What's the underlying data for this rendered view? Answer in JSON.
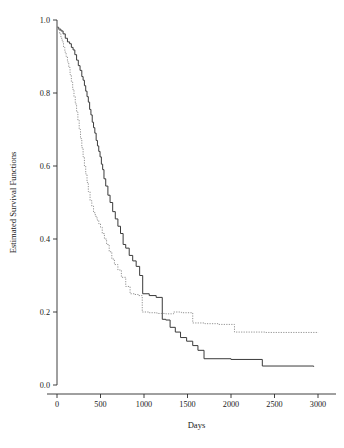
{
  "chart_data": {
    "type": "line",
    "title": "",
    "subtitle": "",
    "xlabel": "Days",
    "ylabel": "Estimated Survival Functions",
    "xlim": [
      0,
      3100
    ],
    "ylim": [
      0.0,
      1.0
    ],
    "xticks": [
      0,
      500,
      1000,
      1500,
      2000,
      2500,
      3000
    ],
    "xtick_labels": [
      "0",
      "500",
      "1000",
      "1500",
      "2000",
      "2500",
      "3000"
    ],
    "yticks": [
      0.0,
      0.2,
      0.4,
      0.6,
      0.8,
      1.0
    ],
    "ytick_labels": [
      "0.0",
      "0.2",
      "0.4",
      "0.6",
      "0.8",
      "1.0"
    ],
    "grid": false,
    "legend": "none",
    "step_type": "post",
    "series": [
      {
        "name": "solid-curve",
        "style": "solid",
        "color": "#3a3a3a",
        "x": [
          0,
          20,
          45,
          70,
          95,
          120,
          145,
          165,
          185,
          205,
          225,
          245,
          265,
          285,
          300,
          315,
          330,
          345,
          360,
          375,
          390,
          405,
          420,
          435,
          450,
          465,
          480,
          495,
          510,
          525,
          540,
          560,
          585,
          610,
          640,
          670,
          700,
          730,
          760,
          790,
          830,
          870,
          910,
          950,
          985,
          1060,
          1140,
          1210,
          1250,
          1300,
          1360,
          1420,
          1490,
          1560,
          1620,
          1690,
          2000,
          2360,
          2950
        ],
        "y": [
          0.98,
          0.975,
          0.97,
          0.962,
          0.95,
          0.94,
          0.935,
          0.925,
          0.918,
          0.905,
          0.89,
          0.875,
          0.862,
          0.845,
          0.835,
          0.82,
          0.805,
          0.79,
          0.775,
          0.755,
          0.74,
          0.72,
          0.705,
          0.69,
          0.67,
          0.655,
          0.64,
          0.625,
          0.605,
          0.59,
          0.565,
          0.545,
          0.52,
          0.5,
          0.475,
          0.455,
          0.435,
          0.415,
          0.385,
          0.375,
          0.355,
          0.34,
          0.325,
          0.3,
          0.25,
          0.245,
          0.24,
          0.18,
          0.178,
          0.158,
          0.145,
          0.13,
          0.12,
          0.108,
          0.095,
          0.072,
          0.07,
          0.052,
          0.05
        ]
      },
      {
        "name": "dotted-curve",
        "style": "dotted",
        "color": "#8c8c8c",
        "x": [
          0,
          15,
          30,
          45,
          60,
          75,
          90,
          105,
          120,
          135,
          150,
          165,
          180,
          195,
          210,
          225,
          240,
          255,
          270,
          285,
          300,
          315,
          330,
          345,
          360,
          380,
          400,
          420,
          440,
          460,
          480,
          500,
          520,
          545,
          570,
          600,
          630,
          660,
          700,
          740,
          790,
          840,
          890,
          935,
          980,
          1060,
          1150,
          1250,
          1340,
          1430,
          1560,
          1700,
          1850,
          2040,
          2400,
          3000
        ],
        "y": [
          0.98,
          0.972,
          0.962,
          0.95,
          0.94,
          0.925,
          0.912,
          0.9,
          0.885,
          0.87,
          0.85,
          0.83,
          0.81,
          0.79,
          0.77,
          0.748,
          0.725,
          0.7,
          0.675,
          0.65,
          0.625,
          0.6,
          0.578,
          0.555,
          0.53,
          0.505,
          0.49,
          0.472,
          0.462,
          0.452,
          0.442,
          0.432,
          0.415,
          0.4,
          0.385,
          0.365,
          0.345,
          0.33,
          0.315,
          0.295,
          0.27,
          0.25,
          0.248,
          0.245,
          0.2,
          0.198,
          0.196,
          0.195,
          0.2,
          0.198,
          0.17,
          0.168,
          0.166,
          0.145,
          0.144,
          0.143
        ]
      }
    ]
  }
}
